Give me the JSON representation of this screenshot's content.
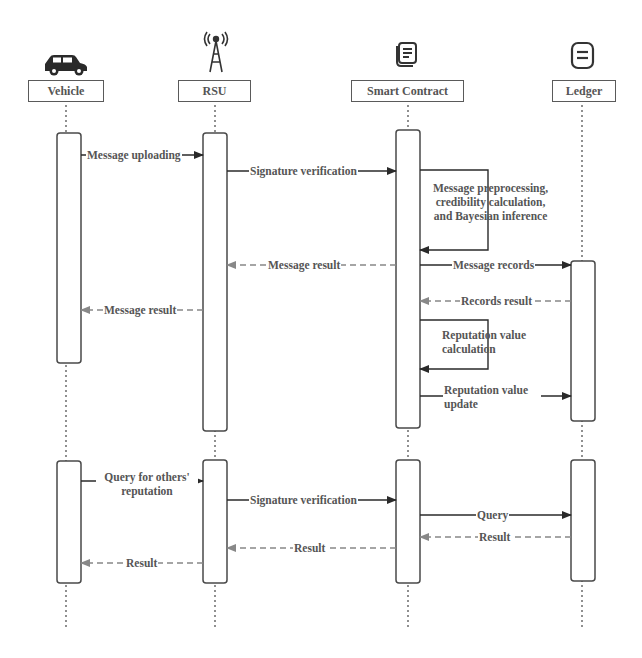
{
  "diagram": {
    "type": "sequence",
    "actors": [
      {
        "id": "vehicle",
        "label": "Vehicle",
        "icon": "car-icon",
        "x": 65
      },
      {
        "id": "rsu",
        "label": "RSU",
        "icon": "antenna-tower-icon",
        "x": 215
      },
      {
        "id": "smart_contract",
        "label": "Smart Contract",
        "icon": "document-stack-icon",
        "x": 408
      },
      {
        "id": "ledger",
        "label": "Ledger",
        "icon": "ledger-icon",
        "x": 582
      }
    ],
    "phases": [
      {
        "name": "Message upload",
        "messages": [
          {
            "from": "vehicle",
            "to": "rsu",
            "label": "Message uploading",
            "style": "solid"
          },
          {
            "from": "rsu",
            "to": "smart_contract",
            "label": "Signature verification",
            "style": "solid"
          },
          {
            "from": "smart_contract",
            "to": "smart_contract",
            "label": "Message preprocessing, credibility calculation, and Bayesian inference",
            "style": "self"
          },
          {
            "from": "smart_contract",
            "to": "rsu",
            "label": "Message result",
            "style": "dashed"
          },
          {
            "from": "smart_contract",
            "to": "ledger",
            "label": "Message records",
            "style": "solid"
          },
          {
            "from": "rsu",
            "to": "vehicle",
            "label": "Message result",
            "style": "dashed"
          },
          {
            "from": "ledger",
            "to": "smart_contract",
            "label": "Records result",
            "style": "dashed"
          },
          {
            "from": "smart_contract",
            "to": "smart_contract",
            "label": "Reputation value calculation",
            "style": "self"
          },
          {
            "from": "smart_contract",
            "to": "ledger",
            "label": "Reputation value update",
            "style": "solid"
          }
        ]
      },
      {
        "name": "Reputation query",
        "messages": [
          {
            "from": "vehicle",
            "to": "rsu",
            "label": "Query for others' reputation",
            "style": "solid"
          },
          {
            "from": "rsu",
            "to": "smart_contract",
            "label": "Signature verification",
            "style": "solid"
          },
          {
            "from": "smart_contract",
            "to": "ledger",
            "label": "Query",
            "style": "solid"
          },
          {
            "from": "ledger",
            "to": "smart_contract",
            "label": "Result",
            "style": "dashed"
          },
          {
            "from": "smart_contract",
            "to": "rsu",
            "label": "Result",
            "style": "dashed"
          },
          {
            "from": "rsu",
            "to": "vehicle",
            "label": "Result",
            "style": "dashed"
          }
        ]
      }
    ]
  },
  "labels": {
    "actor_vehicle": "Vehicle",
    "actor_rsu": "RSU",
    "actor_smart_contract": "Smart Contract",
    "actor_ledger": "Ledger",
    "m1": "Message uploading",
    "m2": "Signature verification",
    "m3_line1": "Message preprocessing,",
    "m3_line2": "credibility calculation,",
    "m3_line3": "and Bayesian inference",
    "m4": "Message result",
    "m5": "Message records",
    "m6": "Message result",
    "m7": "Records result",
    "m8_line1": "Reputation value",
    "m8_line2": "calculation",
    "m9_line1": "Reputation value",
    "m9_line2": "update",
    "q1_line1": "Query for others'",
    "q1_line2": "reputation",
    "q2": "Signature verification",
    "q3": "Query",
    "q4": "Result",
    "q5": "Result",
    "q6": "Result"
  },
  "colors": {
    "line": "#3a3a3a",
    "dashed": "#888888",
    "text": "#555555"
  }
}
